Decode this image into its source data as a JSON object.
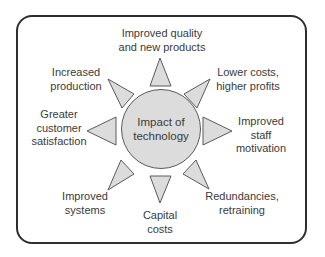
{
  "diagram": {
    "type": "radial",
    "center": {
      "line1": "Impact of",
      "line2": "technology"
    },
    "spokes": [
      {
        "id": "top",
        "line1": "Improved quality",
        "line2": "and new products"
      },
      {
        "id": "top-right",
        "line1": "Lower costs,",
        "line2": "higher profits"
      },
      {
        "id": "right",
        "line1": "Improved",
        "line2": "staff",
        "line3": "motivation"
      },
      {
        "id": "bottom-right",
        "line1": "Redundancies,",
        "line2": "retraining"
      },
      {
        "id": "bottom",
        "line1": "Capital",
        "line2": "costs"
      },
      {
        "id": "bottom-left",
        "line1": "Improved",
        "line2": "systems"
      },
      {
        "id": "left",
        "line1": "Greater",
        "line2": "customer",
        "line3": "satisfaction"
      },
      {
        "id": "top-left",
        "line1": "Increased",
        "line2": "production"
      }
    ],
    "colors": {
      "fill": "#dcdcdc",
      "stroke": "#5a5a5a",
      "border": "#2e2e2e",
      "text": "#3a3a3a"
    }
  }
}
